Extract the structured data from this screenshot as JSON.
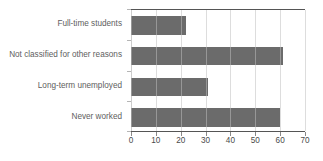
{
  "chart_data": {
    "type": "bar",
    "orientation": "horizontal",
    "title": "",
    "subtitle": "",
    "xlabel": "",
    "ylabel": "",
    "categories": [
      "Full-time students",
      "Not classified for other reasons",
      "Long-term unemployed",
      "Never worked"
    ],
    "values": [
      22,
      61,
      31,
      60
    ],
    "series": [
      {
        "name": "",
        "values": [
          22,
          61,
          31,
          60
        ]
      }
    ],
    "xlim": [
      0,
      70
    ],
    "xticks": [
      0,
      10,
      20,
      30,
      40,
      50,
      60,
      70
    ],
    "xtick_labels": [
      "0",
      "10",
      "20",
      "30",
      "40",
      "50",
      "60",
      "70"
    ],
    "grid": true,
    "grid_axis": "x",
    "legend": false,
    "legend_position": "none",
    "annotations": [],
    "colors": {
      "bar": "#6b6b6b",
      "gridline": "#cfcfcf",
      "axis_line": "#555555",
      "tick_label": "#4a4a4a",
      "category_label": "#5e5e5e",
      "background": "#ffffff"
    }
  }
}
